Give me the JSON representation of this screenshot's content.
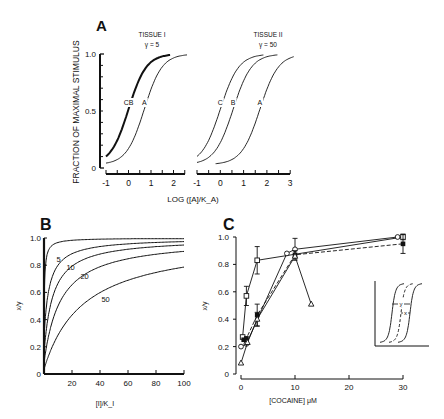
{
  "chart_data": [
    {
      "panel": "A",
      "type": "line",
      "panel_label": "A",
      "ylabel": "FRACTION OF MAXIMAL STIMULUS",
      "xlabel": "LOG ([A]/K_A)",
      "ylim": [
        0,
        1.0
      ],
      "yticks": [
        "0",
        "0.5",
        "1.0"
      ],
      "subplots": [
        {
          "title": "TISSUE I",
          "subtitle": "γ = 5",
          "xlim": [
            -1,
            2.5
          ],
          "xticks": [
            "-1",
            "0",
            "1",
            "2"
          ],
          "series": [
            {
              "name": "CB",
              "ec50_log": 0.0,
              "style": "bold"
            },
            {
              "name": "A",
              "ec50_log": 0.7,
              "style": "thin"
            }
          ]
        },
        {
          "title": "TISSUE II",
          "subtitle": "γ = 50",
          "xlim": [
            -1,
            3
          ],
          "xticks": [
            "-1",
            "0",
            "1",
            "2",
            "3"
          ],
          "series": [
            {
              "name": "C",
              "ec50_log": 0.0,
              "style": "thin"
            },
            {
              "name": "B",
              "ec50_log": 0.55,
              "style": "thin"
            },
            {
              "name": "A",
              "ec50_log": 1.7,
              "style": "thin"
            }
          ]
        }
      ]
    },
    {
      "panel": "B",
      "type": "line",
      "panel_label": "B",
      "xlabel": "[I]/K_I",
      "ylabel": "x/y",
      "xlim": [
        0,
        100
      ],
      "ylim": [
        0,
        1.0
      ],
      "xticks": [
        "20",
        "40",
        "60",
        "80",
        "100"
      ],
      "yticks": [
        "0",
        "0.2",
        "0.4",
        "0.6",
        "0.8",
        "1.0"
      ],
      "series": [
        {
          "name": "1",
          "label": "",
          "k": 1
        },
        {
          "name": "5",
          "label": "5",
          "k": 5
        },
        {
          "name": "10",
          "label": "10",
          "k": 10
        },
        {
          "name": "20",
          "label": "20",
          "k": 20
        },
        {
          "name": "50",
          "label": "50",
          "k": 50
        }
      ]
    },
    {
      "panel": "C",
      "type": "scatter",
      "panel_label": "C",
      "xlabel": "[COCAINE] μM",
      "ylabel": "x/y",
      "xlim": [
        0,
        30
      ],
      "ylim": [
        0,
        1.0
      ],
      "xticks": [
        "0",
        "10",
        "20",
        "30"
      ],
      "yticks": [
        "0",
        "0.2",
        "0.4",
        "0.6",
        "0.8",
        "1.0"
      ],
      "series": [
        {
          "name": "open squares",
          "marker": "square-open",
          "line": "solid",
          "x": [
            0.3,
            1,
            3,
            30
          ],
          "y": [
            0.27,
            0.57,
            0.83,
            1.0
          ],
          "err": [
            0,
            0.07,
            0.1,
            0.02
          ]
        },
        {
          "name": "open circles",
          "marker": "circle-open",
          "line": "solid",
          "x": [
            0,
            1,
            8.5,
            10,
            29
          ],
          "y": [
            0.2,
            0.22,
            0.88,
            0.91,
            1.0
          ],
          "err": [
            0,
            0,
            0,
            0.08,
            0
          ]
        },
        {
          "name": "filled squares",
          "marker": "square-filled",
          "line": "dashed",
          "x": [
            0.5,
            1,
            3,
            10,
            30
          ],
          "y": [
            0.25,
            0.26,
            0.43,
            0.87,
            0.95
          ],
          "err": [
            0,
            0,
            0.08,
            0.03,
            0.07
          ]
        },
        {
          "name": "open triangles",
          "marker": "triangle-open",
          "line": "solid",
          "x": [
            0,
            1.2,
            3,
            10,
            13
          ],
          "y": [
            0.08,
            0.23,
            0.4,
            0.86,
            0.51
          ],
          "err": [
            0,
            0,
            0.05,
            0,
            0
          ]
        }
      ],
      "inset": {
        "labels": [
          "y",
          "x"
        ]
      }
    }
  ]
}
